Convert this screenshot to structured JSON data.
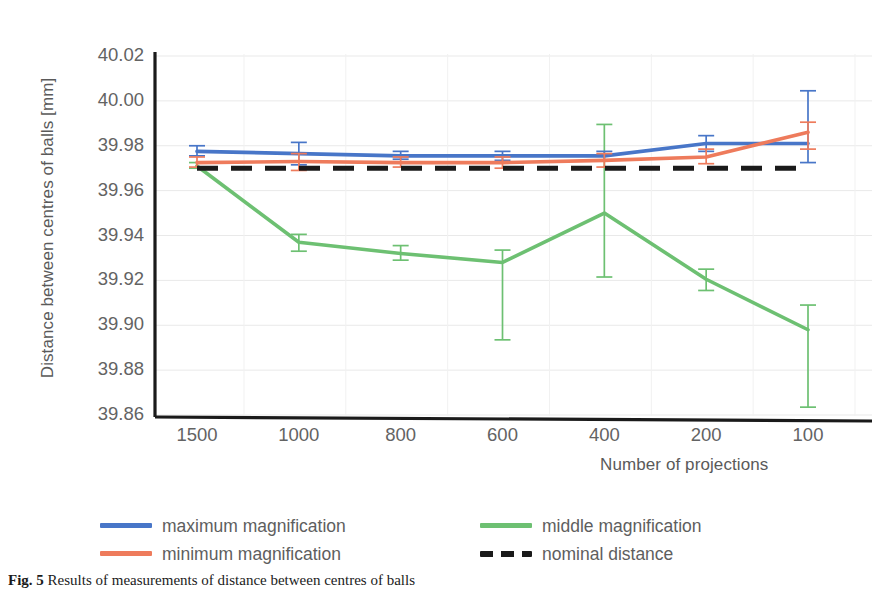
{
  "figure": {
    "caption_label": "Fig. 5",
    "caption_text": "Results of measurements of distance between centres of balls"
  },
  "axes": {
    "y_title": "Distance between centres of balls [mm]",
    "x_title": "Number of projections",
    "y_ticks": [
      "40.02",
      "40.00",
      "39.98",
      "39.96",
      "39.94",
      "39.92",
      "39.90",
      "39.88",
      "39.86"
    ],
    "x_ticks": [
      "1500",
      "1000",
      "800",
      "600",
      "400",
      "200",
      "100"
    ]
  },
  "legend": {
    "items": [
      {
        "label": "maximum magnification",
        "color": "#4876C8",
        "style": "solid"
      },
      {
        "label": "minimum magnification",
        "color": "#EE7B5C",
        "style": "solid"
      },
      {
        "label": "middle magnification",
        "color": "#6DC072",
        "style": "solid"
      },
      {
        "label": "nominal distance",
        "color": "#1A1A1A",
        "style": "dashed"
      }
    ]
  },
  "colors": {
    "maximum": "#4876C8",
    "minimum": "#EE7B5C",
    "middle": "#6DC072",
    "nominal": "#1A1A1A",
    "axis": "#1A1A1A",
    "grid": "#E9E9E9",
    "tick_text": "#636363"
  },
  "chart_data": {
    "type": "line",
    "title": "",
    "xlabel": "Number of projections",
    "ylabel": "Distance between centres of balls [mm]",
    "categories": [
      1500,
      1000,
      800,
      600,
      400,
      200,
      100
    ],
    "ylim": [
      39.86,
      40.02
    ],
    "ytick_step": 0.02,
    "grid": true,
    "legend_position": "below-plot",
    "error_bars": true,
    "series": [
      {
        "name": "maximum magnification",
        "color": "#4876C8",
        "style": "solid",
        "values": [
          39.9775,
          39.9765,
          39.9755,
          39.9755,
          39.9755,
          39.981,
          39.981
        ],
        "err_low": [
          39.9755,
          39.9715,
          39.974,
          39.9735,
          39.9735,
          39.9775,
          39.9725
        ],
        "err_high": [
          39.98,
          39.9815,
          39.9775,
          39.9775,
          39.9775,
          39.9845,
          40.0045
        ]
      },
      {
        "name": "minimum magnification",
        "color": "#EE7B5C",
        "style": "solid",
        "values": [
          39.9725,
          39.973,
          39.9725,
          39.9725,
          39.9735,
          39.975,
          39.986
        ],
        "err_low": [
          39.9705,
          39.969,
          39.9705,
          39.97,
          39.9705,
          39.972,
          39.9785
        ],
        "err_high": [
          39.975,
          39.9765,
          39.975,
          39.975,
          39.9765,
          39.9785,
          39.9905
        ]
      },
      {
        "name": "middle magnification",
        "color": "#6DC072",
        "style": "solid",
        "values": [
          39.971,
          39.937,
          39.932,
          39.928,
          39.95,
          39.9205,
          39.898
        ],
        "err_low": [
          39.97,
          39.933,
          39.929,
          39.8935,
          39.9215,
          39.9155,
          39.8635
        ],
        "err_high": [
          39.9725,
          39.9405,
          39.9355,
          39.9335,
          39.9895,
          39.925,
          39.909
        ]
      },
      {
        "name": "nominal distance",
        "color": "#1A1A1A",
        "style": "dashed",
        "values": [
          39.97,
          39.97,
          39.97,
          39.97,
          39.97,
          39.97,
          39.97
        ]
      }
    ]
  }
}
